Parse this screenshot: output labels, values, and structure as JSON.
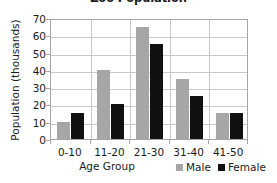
{
  "chart_data": {
    "type": "bar",
    "title": "Zoo Population",
    "xlabel": "Age Group",
    "ylabel": "Population (thousands)",
    "categories": [
      "0-10",
      "11-20",
      "21-30",
      "31-40",
      "41-50"
    ],
    "series": [
      {
        "name": "Male",
        "color": "#a6a6a6",
        "values": [
          10,
          40,
          65,
          35,
          15
        ]
      },
      {
        "name": "Female",
        "color": "#111111",
        "values": [
          15,
          20,
          55,
          25,
          15
        ]
      }
    ],
    "ylim": [
      0,
      70
    ],
    "yticks": [
      0,
      10,
      20,
      30,
      40,
      50,
      60,
      70
    ],
    "ytick_labels": [
      "0",
      "10",
      "20",
      "30",
      "40",
      "50",
      "60",
      "70"
    ],
    "grid": "horizontal-and-vertical",
    "legend_position": "bottom-right"
  },
  "colors": {
    "male": "#a6a6a6",
    "female": "#111111",
    "gridline": "#c9c9c9",
    "axis": "#a6a6a6",
    "text": "#1a1a1a",
    "background": "#ffffff"
  }
}
